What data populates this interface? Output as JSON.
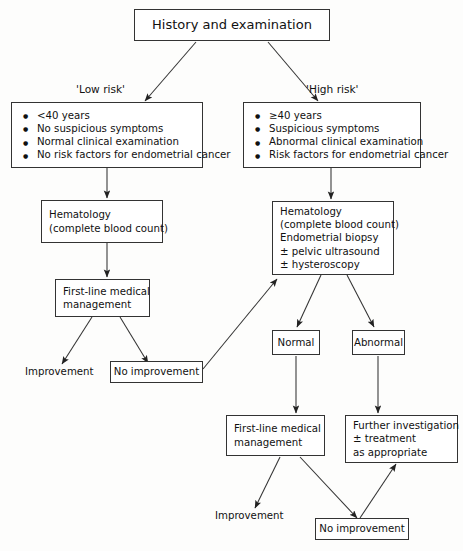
{
  "diagram": {
    "title": "History and examination",
    "branch_labels": {
      "low": "'Low risk'",
      "high": "'High risk'"
    },
    "low_risk_criteria": [
      "<40 years",
      "No suspicious symptoms",
      "Normal clinical examination",
      "No risk factors for endometrial cancer"
    ],
    "high_risk_criteria": [
      "≥40 years",
      "Suspicious symptoms",
      "Abnormal clinical examination",
      "Risk factors for endometrial cancer"
    ],
    "hematology_low": [
      "Hematology",
      "(complete blood count)"
    ],
    "hematology_high": [
      "Hematology",
      "(complete blood count)",
      "Endometrial biopsy",
      "± pelvic ultrasound",
      "± hysteroscopy"
    ],
    "first_line_left": [
      "First-line medical",
      "management"
    ],
    "first_line_bottom": [
      "First-line medical",
      "management"
    ],
    "further_investigation": [
      "Further investigation",
      "± treatment",
      "as appropriate"
    ],
    "outcome_normal": "Normal",
    "outcome_abnormal": "Abnormal",
    "improvement_left": "Improvement",
    "improvement_bottom": "Improvement",
    "no_improvement_left": "No improvement",
    "no_improvement_bottom": "No improvement",
    "colors": {
      "stroke": "#333333",
      "text": "#111111",
      "background": "#fdfdfc"
    }
  }
}
